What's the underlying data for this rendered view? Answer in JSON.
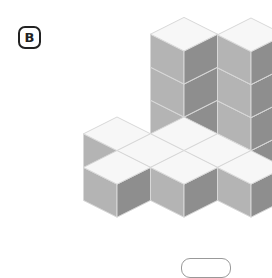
{
  "figure": {
    "label": "B",
    "colors": {
      "top": "#f7f7f7",
      "left": "#b4b4b4",
      "right": "#8e8e8e",
      "edge": "#d8d8d8",
      "badge_border": "#222222",
      "answer_box_border": "#999999"
    },
    "iso": {
      "origin_x": 117,
      "origin_y": 150,
      "half_w": 33.5,
      "half_h": 16.8,
      "cube_h": 33
    },
    "cubes": [
      {
        "gx": 0,
        "gy": -2,
        "z": 0
      },
      {
        "gx": 0,
        "gy": -2,
        "z": 1
      },
      {
        "gx": 0,
        "gy": -2,
        "z": 2
      },
      {
        "gx": 2,
        "gy": -2,
        "z": 0
      },
      {
        "gx": 2,
        "gy": -2,
        "z": 1
      },
      {
        "gx": 2,
        "gy": -2,
        "z": 2
      },
      {
        "gx": 2,
        "gy": -2,
        "z": 3
      },
      {
        "gx": 1,
        "gy": -1,
        "z": 0
      },
      {
        "gx": 2,
        "gy": -1,
        "z": 0
      },
      {
        "gx": 3,
        "gy": -1,
        "z": 0
      },
      {
        "gx": 0,
        "gy": 0,
        "z": 0
      },
      {
        "gx": 1,
        "gy": 0,
        "z": 0
      },
      {
        "gx": 2,
        "gy": 0,
        "z": 0
      },
      {
        "gx": 1,
        "gy": 1,
        "z": 0
      }
    ]
  },
  "answer_box": {
    "value": ""
  }
}
